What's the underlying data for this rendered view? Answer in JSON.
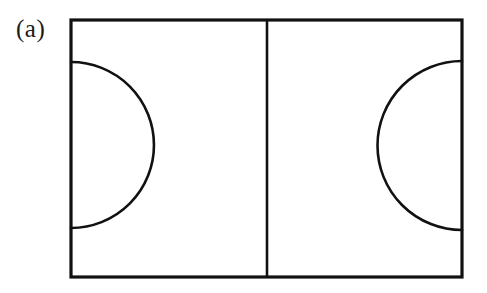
{
  "figure": {
    "label": "(a)",
    "caption_letter": "a",
    "background_color": "#ffffff",
    "stroke_color": "#111111",
    "canvas": {
      "width": 487,
      "height": 293
    }
  },
  "diagram": {
    "name": "court-plan-diagram",
    "stroke_width_border": 3.2,
    "stroke_width_centre_line": 2.6,
    "stroke_width_arc": 2.6,
    "boundary": {
      "name": "outer-boundary-rectangle",
      "x": 71,
      "y": 20,
      "width": 391,
      "height": 257
    },
    "centre_line": {
      "name": "centre-line",
      "x": 267,
      "y1": 20,
      "y2": 277
    },
    "left_arc": {
      "name": "left-semicircle",
      "center_x": 71,
      "center_y": 145,
      "radius": 83,
      "start_x": 71,
      "start_y": 62,
      "end_x": 71,
      "end_y": 228,
      "apex_x": 151,
      "bulge_direction": "right"
    },
    "right_arc": {
      "name": "right-semicircle",
      "center_x": 462,
      "center_y": 145,
      "radius": 84,
      "start_x": 462,
      "start_y": 61,
      "end_x": 462,
      "end_y": 230,
      "apex_x": 383,
      "bulge_direction": "left"
    }
  }
}
